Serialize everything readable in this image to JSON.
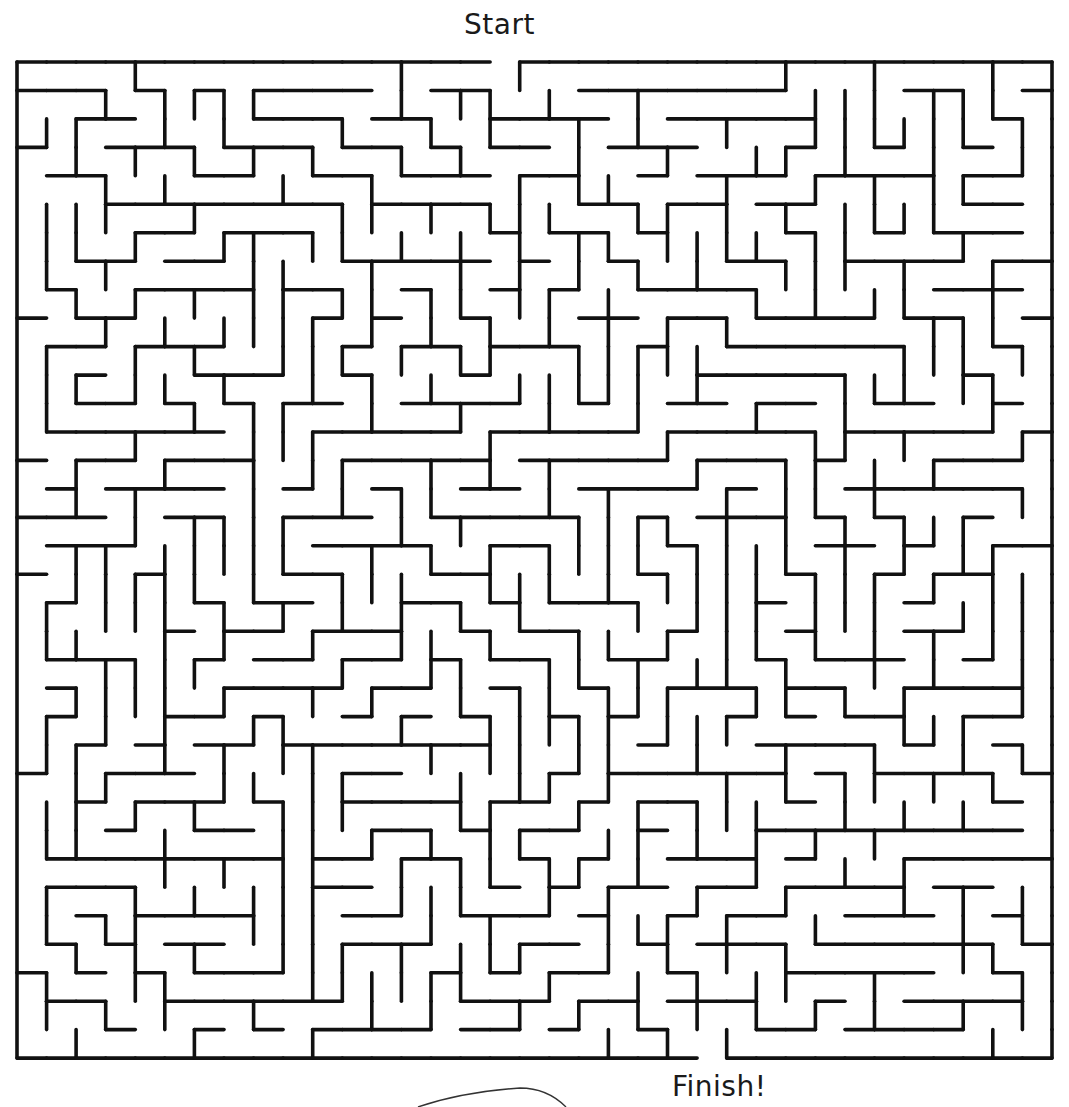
{
  "labels": {
    "start": "Start",
    "finish": "Finish!"
  },
  "maze": {
    "cols": 35,
    "rows": 35,
    "origin_x": 17,
    "origin_y": 62,
    "cell_w": 29.57,
    "cell_h": 28.46,
    "wall_color": "#111111",
    "wall_width": 3.6,
    "background": "#ffffff",
    "entrance": {
      "side": "top",
      "col": 16
    },
    "exit": {
      "side": "bottom",
      "col": 23
    },
    "seed": 20240607
  },
  "doodle": {
    "stroke": "#333333",
    "path": "M418 1107 C 450 1096, 490 1090, 520 1088 C 540 1088, 555 1096, 566 1107"
  }
}
